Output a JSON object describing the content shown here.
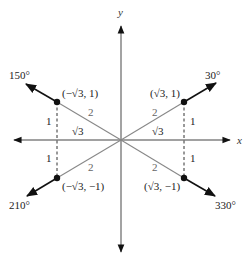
{
  "diagram": {
    "type": "reference-angles-30-degree",
    "axes": {
      "x_label": "x",
      "y_label": "y"
    },
    "colors": {
      "terminal_ray": "#111111",
      "hypotenuse": "#777777",
      "axis": "#444444",
      "dashed": "#333333"
    },
    "angles": [
      {
        "label": "30°",
        "point": "(√3, 1)"
      },
      {
        "label": "150°",
        "point": "(−√3, 1)"
      },
      {
        "label": "210°",
        "point": "(−√3, −1)"
      },
      {
        "label": "330°",
        "point": "(√3, −1)"
      }
    ],
    "side_labels": {
      "hypotenuse": "2",
      "adjacent": "√3",
      "opposite": "1"
    }
  }
}
